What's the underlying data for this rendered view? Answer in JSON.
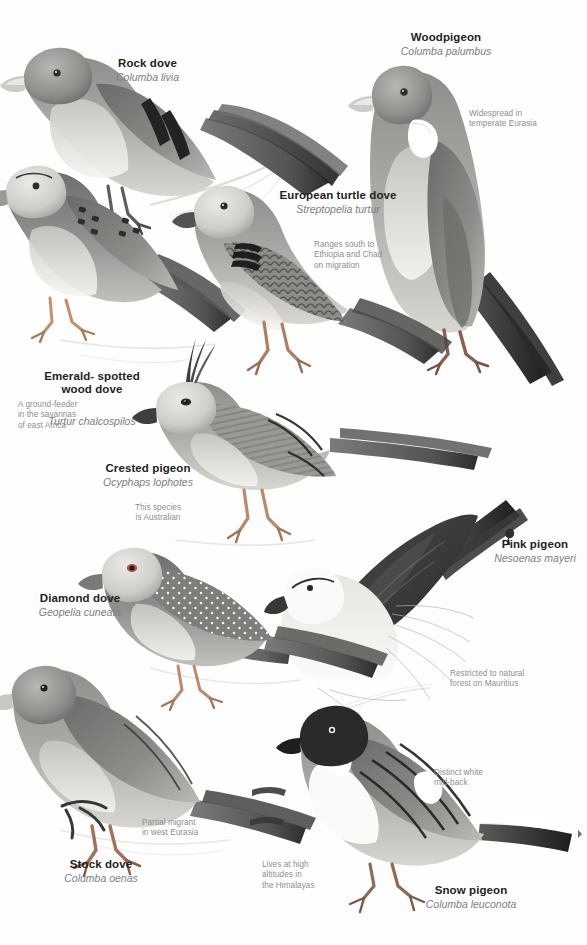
{
  "page": {
    "background": "#fefefe",
    "text_color": "#231f20",
    "sci_color": "#7b7f82",
    "note_color": "#8b8f93"
  },
  "species": [
    {
      "id": "rock-dove",
      "common": "Rock dove",
      "scientific": "Columba livia",
      "note": ""
    },
    {
      "id": "woodpigeon",
      "common": "Woodpigeon",
      "scientific": "Columba palumbus",
      "note": "Widespread in\ntemperate Eurasia"
    },
    {
      "id": "european-turtle-dove",
      "common": "European turtle dove",
      "scientific": "Streptopelia turtur",
      "note": "Ranges south to\nEthiopia and Chad\non migration"
    },
    {
      "id": "emerald-spotted-wood-dove",
      "common": "Emerald- spotted\nwood dove",
      "scientific": "Turtur chalcospilos",
      "note": "A ground-feeder\nin the savannas\nof east Africa"
    },
    {
      "id": "crested-pigeon",
      "common": "Crested pigeon",
      "scientific": "Ocyphaps lophotes",
      "note": "This species\nis Australian"
    },
    {
      "id": "pink-pigeon",
      "common": "Pink pigeon",
      "scientific": "Nesoenas mayeri",
      "note": "Restricted to natural\nforest on Mauritius"
    },
    {
      "id": "diamond-dove",
      "common": "Diamond dove",
      "scientific": "Geopelia cuneata",
      "note": ""
    },
    {
      "id": "stock-dove",
      "common": "Stock dove",
      "scientific": "Columba oenas",
      "note": "Partial migrant\nin west Eurasia"
    },
    {
      "id": "snow-pigeon",
      "common": "Snow pigeon",
      "scientific": "Columba leuconota",
      "note": "Lives at high\naltitudes in\nthe Himalayas"
    }
  ],
  "callouts": [
    {
      "id": "snow-pigeon-midback",
      "text": "Distinct white\nmid-back"
    }
  ]
}
